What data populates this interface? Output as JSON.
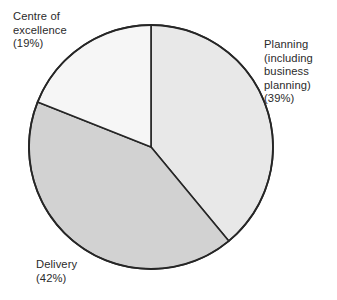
{
  "chart_data": {
    "type": "pie",
    "title": "",
    "subtitle": "",
    "xlabel": "",
    "ylabel": "",
    "legend_position": "none",
    "grid": false,
    "labels_outside": true,
    "start_angle_deg": 0,
    "direction": "clockwise",
    "categories": [
      "Planning (including business planning)",
      "Delivery",
      "Centre of excellence"
    ],
    "values": [
      39,
      42,
      19
    ],
    "unit": "%",
    "slices": [
      {
        "name": "Planning (including business planning)",
        "value": 39,
        "label_text": "Planning\n(including\nbusiness\nplanning)\n(39%)",
        "percent_text": "(39%)",
        "color": "#e8e8e8",
        "start_deg": 0,
        "end_deg": 140.4
      },
      {
        "name": "Delivery",
        "value": 42,
        "label_text": "Delivery\n(42%)",
        "percent_text": "(42%)",
        "color": "#d2d2d2",
        "start_deg": 140.4,
        "end_deg": 291.6
      },
      {
        "name": "Centre of excellence",
        "value": 19,
        "label_text": "Centre of\nexcellence\n(19%)",
        "percent_text": "(19%)",
        "color": "#f6f6f6",
        "start_deg": 291.6,
        "end_deg": 360
      }
    ],
    "style": {
      "background": "#ffffff",
      "outline_color": "#262626",
      "outline_width": 1.6,
      "text_color": "#2b2b2b",
      "center_x": 151,
      "center_y": 147,
      "radius": 122
    }
  }
}
